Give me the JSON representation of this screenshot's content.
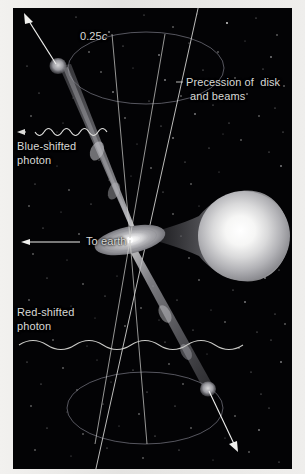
{
  "figure": {
    "background_color": "#030305",
    "margin_color": "#eeedeb"
  },
  "labels": {
    "speed": "0.25",
    "speed_unit": "c",
    "precession_line1": "Precession of  disk",
    "precession_line2": "and beams",
    "blueshift_line1": "Blue-shifted",
    "blueshift_line2": "photon",
    "redshift_line1": "Red-shifted",
    "redshift_line2": "photon",
    "to_earth": "To earth"
  },
  "colors": {
    "jet": "#8f8f93",
    "jet_glow": "#b9b9bd",
    "disk": "#cfcfd2",
    "star_core": "#ffffff",
    "star_edge": "#9b9ba0",
    "line": "#d6d6d4",
    "ellipse": "#6d6d70",
    "wave": "#cfcfcd",
    "star_field": "#ffffff"
  },
  "elements": {
    "companion_star_name": "companion-star",
    "accretion_disk_name": "accretion-disk",
    "upper_jet_name": "upper-jet-beam",
    "lower_jet_name": "lower-jet-beam",
    "upper_blob_name": "upper-jet-blob",
    "lower_blob_name": "lower-jet-blob",
    "precession_axis_name": "precession-axis-line",
    "upper_cone_name": "upper-precession-ellipse",
    "lower_cone_name": "lower-precession-ellipse"
  },
  "geometry": {
    "disk_center_x": 117,
    "disk_center_y": 232,
    "upper_blob_x": 42,
    "upper_blob_y": 62,
    "lower_blob_x": 196,
    "lower_blob_y": 386,
    "speed_arrow_tip_x": 24,
    "speed_arrow_tip_y": 16,
    "to_earth_arrow_tip_x": 9,
    "to_earth_arrow_tip_y": 234
  }
}
